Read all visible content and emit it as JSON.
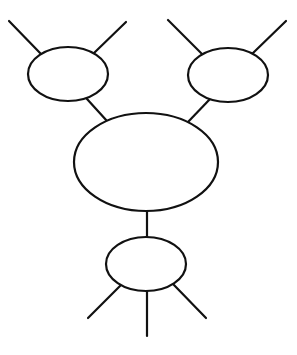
{
  "diagram": {
    "stroke_color": "#111111",
    "background": "#ffffff",
    "stroke_width": 2.2,
    "nodes": [
      {
        "id": "top-left",
        "cx": 68,
        "cy": 74,
        "rx": 40,
        "ry": 27
      },
      {
        "id": "top-right",
        "cx": 228,
        "cy": 75,
        "rx": 40,
        "ry": 27
      },
      {
        "id": "center",
        "cx": 146,
        "cy": 162,
        "rx": 72,
        "ry": 49
      },
      {
        "id": "bottom",
        "cx": 146,
        "cy": 264,
        "rx": 40,
        "ry": 27
      }
    ],
    "edges": [
      {
        "id": "top-left-stub-left",
        "x1": 9,
        "y1": 21,
        "x2": 41,
        "y2": 54
      },
      {
        "id": "top-left-stub-right",
        "x1": 126,
        "y1": 22,
        "x2": 94,
        "y2": 53
      },
      {
        "id": "top-left-to-center",
        "x1": 87,
        "y1": 99,
        "x2": 107,
        "y2": 121
      },
      {
        "id": "top-right-stub-left",
        "x1": 168,
        "y1": 20,
        "x2": 202,
        "y2": 54
      },
      {
        "id": "top-right-stub-right",
        "x1": 286,
        "y1": 21,
        "x2": 253,
        "y2": 53
      },
      {
        "id": "top-right-to-center",
        "x1": 210,
        "y1": 99,
        "x2": 188,
        "y2": 122
      },
      {
        "id": "center-to-bottom",
        "x1": 147,
        "y1": 211,
        "x2": 147,
        "y2": 237
      },
      {
        "id": "bottom-stub-left",
        "x1": 121,
        "y1": 285,
        "x2": 88,
        "y2": 318
      },
      {
        "id": "bottom-stub-middle",
        "x1": 147,
        "y1": 291,
        "x2": 147,
        "y2": 336
      },
      {
        "id": "bottom-stub-right",
        "x1": 173,
        "y1": 284,
        "x2": 206,
        "y2": 318
      }
    ]
  }
}
